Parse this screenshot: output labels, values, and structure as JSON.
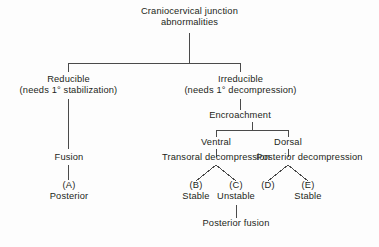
{
  "diagram": {
    "title_node": {
      "line1": "Craniocervical junction",
      "line2": "abnormalities"
    },
    "level2": {
      "left": {
        "line1": "Reducible",
        "line2": "(needs 1° stabilization)"
      },
      "right": {
        "line1": "Irreducible",
        "line2": "(needs 1° decompression)"
      }
    },
    "encroachment": "Encroachment",
    "encroachment_children": {
      "ventral": "Ventral",
      "dorsal": "Dorsal"
    },
    "procedures": {
      "fusion": "Fusion",
      "transoral": "Transoral decompression",
      "posterior": "Posterior decompression"
    },
    "outcomes": [
      {
        "tag": "(A)",
        "label": "Posterior"
      },
      {
        "tag": "(B)",
        "label": "Stable"
      },
      {
        "tag": "(C)",
        "label": "Unstable"
      },
      {
        "tag": "(D)",
        "label": ""
      },
      {
        "tag": "(E)",
        "label": "Stable"
      }
    ],
    "outcome_d_label": "",
    "terminal": "Posterior fusion",
    "colors": {
      "ink": "#231f20",
      "connector": "#4a4a4a",
      "background": "#fdfdfd"
    }
  }
}
